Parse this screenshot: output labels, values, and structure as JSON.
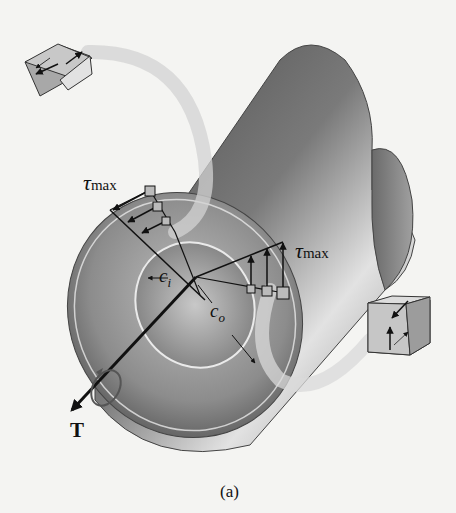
{
  "figure": {
    "caption": "(a)"
  },
  "labels": {
    "tau_left": {
      "symbol": "τ",
      "subscript": "max"
    },
    "tau_right": {
      "symbol": "τ",
      "subscript": "max"
    },
    "inner_radius": {
      "symbol": "c",
      "subscript": "i"
    },
    "outer_radius": {
      "symbol": "c",
      "subscript": "o"
    },
    "torque": "T"
  },
  "elements": {
    "tube": "hollow circular shaft",
    "stress_elements": [
      "top-left cube",
      "bottom-right cube"
    ],
    "stress_distribution": [
      "left linear distribution",
      "right linear distribution"
    ]
  },
  "colors": {
    "background": "#f4f4f2",
    "tube_dark": "#5a5a5a",
    "tube_light": "#d8d8d8",
    "ink": "#111111",
    "ribbon": "#d0d0d0"
  }
}
